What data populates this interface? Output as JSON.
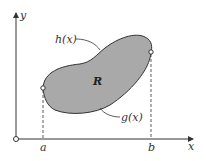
{
  "diagram": {
    "axes": {
      "x_label": "x",
      "y_label": "y"
    },
    "ticks": {
      "a": "a",
      "b": "b"
    },
    "region_label": "R",
    "upper_curve_label": "h(x)",
    "lower_curve_label": "g(x)",
    "colors": {
      "region_fill": "#a9a9a9",
      "stroke": "#333333"
    }
  }
}
